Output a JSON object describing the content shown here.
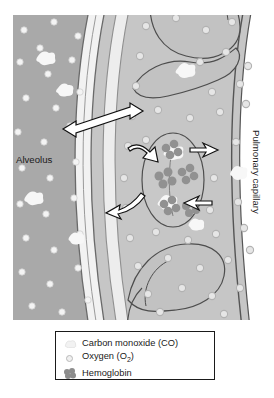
{
  "figure": {
    "type": "biology-diagram",
    "labels": {
      "alveolus": "Alveolus",
      "capillary": "Pulmonary capillary"
    },
    "colors": {
      "alveolus_fill": "#a9a9a9",
      "capillary_fill": "#c6c6c6",
      "membrane_fill": "#f2f2f2",
      "tissue_fill": "#d9d9d9",
      "rbc_fill": "#c0c0c0",
      "rbc_stroke": "#4d4d4d",
      "oxygen_in_alveolus": "#f4f4f4",
      "oxygen_in_capillary": "#e3e3e3",
      "oxygen_stroke": "#b4b4b4",
      "carbon_monoxide": "#f5f5f5",
      "hemoglobin": "#8d8d8d",
      "arrow": "#111111",
      "outline": "#444444",
      "legend_border": "#1a1a1a",
      "text": "#1a1a1a"
    },
    "elements": {
      "diffusion_arrow": "double-headed arrow across alveolar-capillary membrane",
      "binding_arrows": "curved arrows showing gas entering and leaving red blood cell",
      "red_blood_cells": 3
    }
  },
  "legend": {
    "items": [
      {
        "icon": "carbon-monoxide-icon",
        "label": "Carbon monoxide (CO)"
      },
      {
        "icon": "oxygen-icon",
        "label_pre": "Oxygen (O",
        "label_sub": "2",
        "label_post": ")"
      },
      {
        "icon": "hemoglobin-icon",
        "label": "Hemoglobin"
      }
    ]
  }
}
